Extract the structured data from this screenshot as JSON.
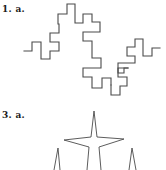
{
  "problems": [
    {
      "number_label": "1.",
      "part_label": "a.",
      "full_label": "1. a.",
      "figure": "fractal-curve-iteration"
    },
    {
      "number_label": "3.",
      "part_label": "a.",
      "full_label": "3. a.",
      "figure": "star-fractal-iteration"
    }
  ],
  "colors": {
    "background": "#ffffff",
    "line": "#4a4a4a",
    "text": "#1a1a1a"
  }
}
